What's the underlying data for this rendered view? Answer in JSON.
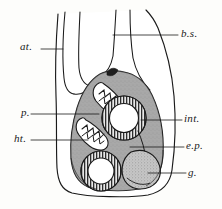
{
  "figure": {
    "style": "line drawing with gray wash and stipple",
    "background_color": "#fdfdfb",
    "ink_color": "#1a1a1a",
    "fills": {
      "body_cavity": "#ffffff",
      "tissue_gray": "#a8a8a8",
      "tissue_gray_dark": "#8f8f8f",
      "gland_stipple": "#bcbcbc",
      "lumen_white": "#ffffff",
      "muscle_ring": "#3a3a3a"
    }
  },
  "labels": [
    {
      "id": "at",
      "text": "at.",
      "meaning": "atrium",
      "x": 20,
      "y": 41,
      "leader": {
        "x1": 41,
        "y1": 49,
        "x2": 63,
        "y2": 49
      }
    },
    {
      "id": "bs",
      "text": "b.s.",
      "meaning": "blood sinus",
      "x": 181,
      "y": 28,
      "leader": {
        "x1": 113,
        "y1": 35,
        "x2": 178,
        "y2": 35
      }
    },
    {
      "id": "p",
      "text": "p.",
      "meaning": "pharynx",
      "x": 21,
      "y": 107,
      "leader": {
        "x1": 31,
        "y1": 114,
        "x2": 99,
        "y2": 114
      }
    },
    {
      "id": "ht",
      "text": "ht.",
      "meaning": "heart",
      "x": 14,
      "y": 133,
      "leader": {
        "x1": 31,
        "y1": 140,
        "x2": 88,
        "y2": 140
      }
    },
    {
      "id": "int",
      "text": "int.",
      "meaning": "intestine",
      "x": 184,
      "y": 113,
      "leader": {
        "x1": 141,
        "y1": 120,
        "x2": 182,
        "y2": 120
      }
    },
    {
      "id": "ep",
      "text": "e.p.",
      "meaning": "epidermis / parenchyma",
      "x": 186,
      "y": 140,
      "leader": {
        "x1": 130,
        "y1": 147,
        "x2": 184,
        "y2": 147
      }
    },
    {
      "id": "g",
      "text": "g.",
      "meaning": "gonad / gland",
      "x": 188,
      "y": 167,
      "leader": {
        "x1": 148,
        "y1": 173,
        "x2": 186,
        "y2": 173
      }
    }
  ],
  "structures": [
    {
      "id": "body-outline",
      "name": "body-wall-outline"
    },
    {
      "id": "atrial-tube",
      "name": "atrial-tube"
    },
    {
      "id": "blood-sinus",
      "name": "blood-sinus-channel"
    },
    {
      "id": "visceral-mass",
      "name": "visceral-mass"
    },
    {
      "id": "pharynx-cavity",
      "name": "pharynx-cavity"
    },
    {
      "id": "heart-cavity",
      "name": "heart-cavity"
    },
    {
      "id": "intestine-ring",
      "name": "intestine-ring"
    },
    {
      "id": "gut-ring-lower",
      "name": "lower-gut-ring"
    },
    {
      "id": "gland-mass",
      "name": "gland-mass"
    }
  ]
}
